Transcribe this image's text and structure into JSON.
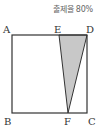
{
  "header": {
    "rate_text": "출제율 80%"
  },
  "diagram": {
    "shape": "square ABCD with shaded triangle EFD",
    "points": {
      "A": {
        "label": "A",
        "x": 12,
        "y": 35
      },
      "B": {
        "label": "B",
        "x": 12,
        "y": 113
      },
      "C": {
        "label": "C",
        "x": 87,
        "y": 113
      },
      "D": {
        "label": "D",
        "x": 87,
        "y": 35
      },
      "E": {
        "label": "E",
        "x": 59,
        "y": 35
      },
      "F": {
        "label": "F",
        "x": 68,
        "y": 113
      }
    },
    "shaded_region": [
      "E",
      "F",
      "D"
    ],
    "colors": {
      "stroke": "#333333",
      "fill": "#c8c8c8"
    }
  }
}
